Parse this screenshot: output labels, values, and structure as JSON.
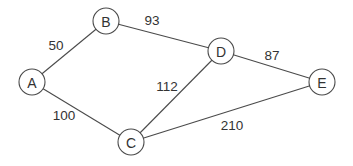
{
  "graph": {
    "type": "weighted-undirected-graph",
    "nodes": [
      {
        "id": "A",
        "label": "A",
        "x": 32,
        "y": 82
      },
      {
        "id": "B",
        "label": "B",
        "x": 106,
        "y": 21
      },
      {
        "id": "C",
        "label": "C",
        "x": 131,
        "y": 142
      },
      {
        "id": "D",
        "label": "D",
        "x": 221,
        "y": 51
      },
      {
        "id": "E",
        "label": "E",
        "x": 322,
        "y": 82
      }
    ],
    "edges": [
      {
        "from": "A",
        "to": "B",
        "weight": "50",
        "label_x": 56,
        "label_y": 45
      },
      {
        "from": "B",
        "to": "D",
        "weight": "93",
        "label_x": 152,
        "label_y": 20
      },
      {
        "from": "A",
        "to": "C",
        "weight": "100",
        "label_x": 64,
        "label_y": 115
      },
      {
        "from": "C",
        "to": "D",
        "weight": "112",
        "label_x": 167,
        "label_y": 86
      },
      {
        "from": "D",
        "to": "E",
        "weight": "87",
        "label_x": 272,
        "label_y": 55
      },
      {
        "from": "C",
        "to": "E",
        "weight": "210",
        "label_x": 232,
        "label_y": 125
      }
    ],
    "node_radius": 13,
    "colors": {
      "stroke": "#4a4a4a",
      "text": "#333333",
      "background": "#ffffff"
    }
  }
}
